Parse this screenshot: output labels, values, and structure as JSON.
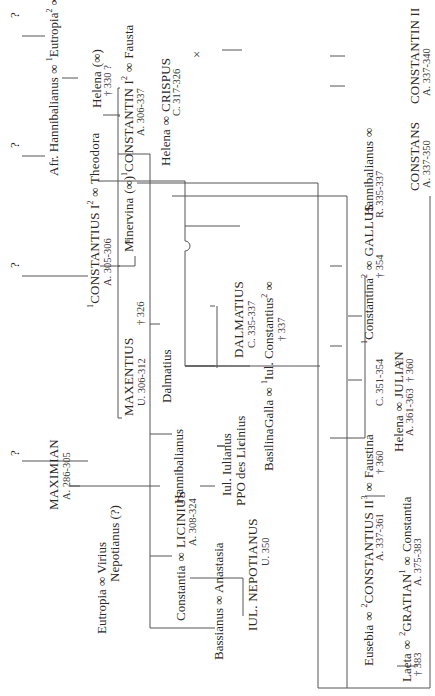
{
  "diagram": {
    "orientation": "rotated 90deg counter-clockwise",
    "marriage_symbol": "∞",
    "unknown_parent": "?",
    "persons": {
      "q1": "?",
      "q2": "?",
      "q3": "?",
      "q4": "?",
      "helena1": "Helena",
      "helena1_marr": "(∞)",
      "helena1_note": "† 330 ?",
      "constantius1_pre": "1",
      "constantius1": "CONSTANTIUS I",
      "constantius1_sup": "2",
      "constantius1_reign": "A. 305-306",
      "theodora": "Theodora",
      "afr_hannibalianus": "Afr. Hannibalianus",
      "eutropia1_pre": "1",
      "eutropia1": "Eutropia",
      "eutropia1_sup": "2",
      "maximian": "MAXIMIAN",
      "maximian_reign": "A. 286-305",
      "minervina": "Minervina",
      "minervina_marr": "(∞)",
      "constantin1_pre": "1",
      "constantin1": "CONSTANTIN I",
      "constantin1_sup": "2",
      "constantin1_reign": "A. 306-337",
      "fausta": "Fausta",
      "fausta_note": "† 326",
      "maxentius": "MAXENTIUS",
      "maxentius_reign": "U. 306-312",
      "helena2": "Helena",
      "crispus": "CRISPUS",
      "crispus_reign": "C. 317-326",
      "crispus_child": "×",
      "dalmatius": "Dalmatius",
      "hannibalianus1": "Hannibalianus",
      "constantia1": "Constantia",
      "licinius": "LICINIUS",
      "licinius_reign": "A. 308-324",
      "eutropia2": "Eutropia",
      "virius": "Virius",
      "virius2": "Nepotianus (?)",
      "bassianus": "Bassianus",
      "anastasia": "Anastasia",
      "dalmatius_c": "DALMATIUS",
      "dalmatius_c_reign": "C. 335-337",
      "iul_iulianus": "Iul. Iulianus",
      "iul_iulianus_title": "PPO des Licinius",
      "basilina": "Basilina",
      "iul_nepotianus": "IUL. NEPOTIANUS",
      "iul_nepotianus_reign": "U. 350",
      "galla": "Galla",
      "iul_constantius_pre": "1",
      "iul_constantius": "Iul. Constantius",
      "iul_constantius_sup": "2",
      "iul_constantius_note": "† 337",
      "hannibalianus2": "Hannibalianus",
      "hannibalianus2_reign": "R. 335-337",
      "constantina_pre": "1",
      "constantina": "Constantina",
      "constantina_sup": "2",
      "constantina_note": "† 354",
      "gallus": "GALLUS",
      "gallus_reign": "C. 351-354",
      "gallus_child": "♀",
      "helena3": "Helena",
      "helena3_note": "† 360",
      "julian": "JULIAN",
      "julian_reign": "A. 361-363",
      "eusebia": "Eusebia",
      "eusebia_note": "† 360",
      "constantius2_pre": "2",
      "constantius2": "CONSTANTIUS II",
      "constantius2_sup": "3",
      "constantius2_reign": "A. 337-361",
      "faustina": "Faustina",
      "constantin2": "CONSTANTIN II",
      "constantin2_reign": "A. 337-340",
      "constans": "CONSTANS",
      "constans_reign": "A. 337-350",
      "laeta": "Laeta",
      "gratian_pre": "2",
      "gratian": "GRATIAN",
      "gratian_sup": "1",
      "gratian_reign": "A. 375-383",
      "constantia2": "Constantia",
      "constantia2_note": "† 383"
    }
  }
}
